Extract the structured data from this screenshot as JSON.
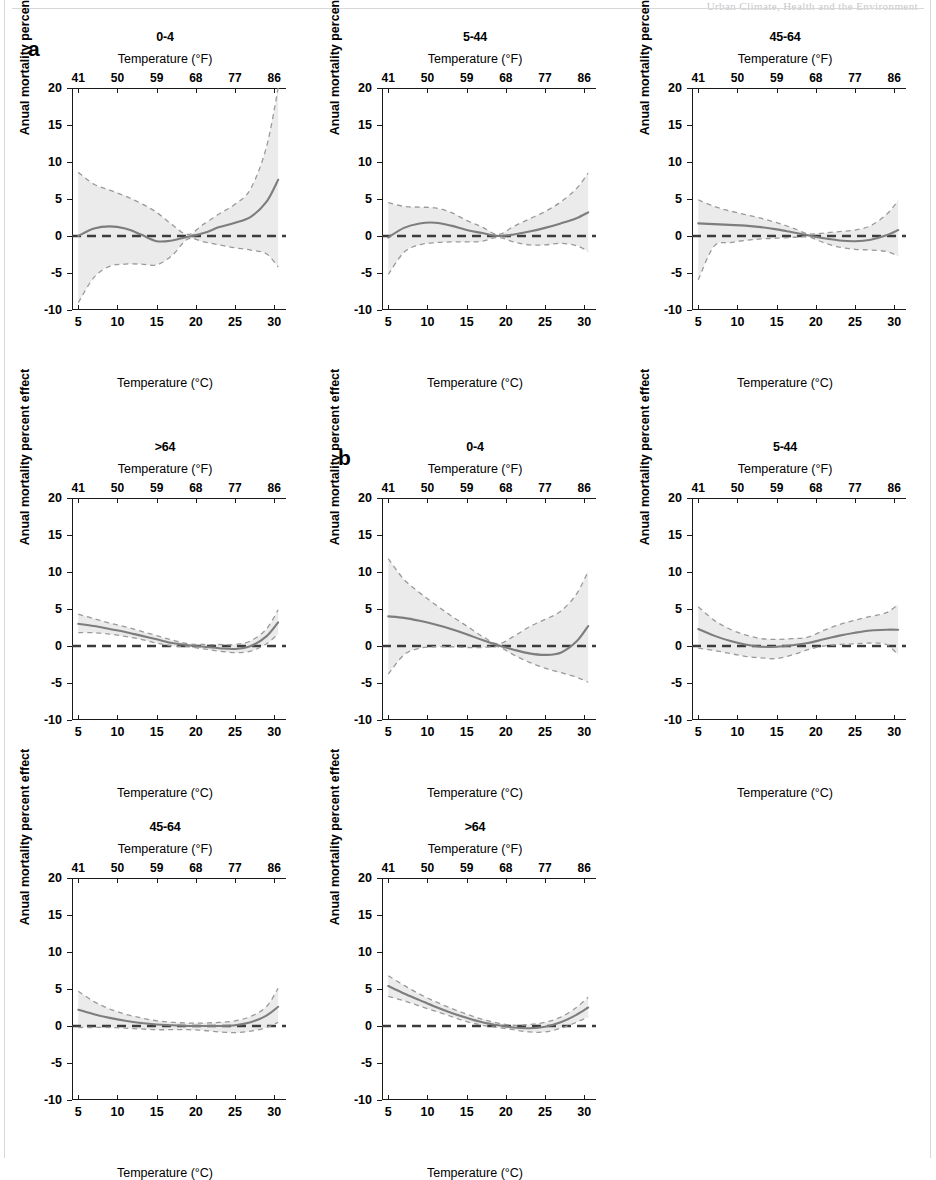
{
  "figure": {
    "running_header": "Urban Climate, Health and the Environment",
    "panel_labels": {
      "a": "a",
      "b": "b"
    },
    "axis": {
      "ylabel": "Anual mortality percent effect",
      "xlabel_c": "Temperature (°C)",
      "xlabel_f": "Temperature (°F)",
      "yticks": [
        20,
        15,
        10,
        5,
        0,
        -5,
        -10
      ],
      "xticks_c": [
        5,
        10,
        15,
        20,
        25,
        30
      ],
      "xticks_f": [
        41,
        50,
        59,
        68,
        77,
        86
      ],
      "ylim": [
        -10,
        20
      ],
      "xlim": [
        4.2,
        31.5
      ]
    },
    "colors": {
      "curve": "#7d7d7d",
      "ci": "#9a9a9a",
      "band": "#ebebeb",
      "zero_line": "#3c3c3c",
      "axis": "#1a1a1a"
    }
  },
  "chart_data": {
    "type": "line",
    "xlabel": "Temperature (°C)",
    "ylabel": "Anual mortality percent effect",
    "xlim": [
      4.2,
      31.5
    ],
    "ylim": [
      -10,
      20
    ],
    "grid": false,
    "legend": "none",
    "secondary_xaxis": {
      "label": "Temperature (°F)",
      "ticks": [
        41,
        50,
        59,
        68,
        77,
        86
      ]
    },
    "x": [
      5,
      7,
      9,
      11,
      13,
      15,
      17,
      19,
      21,
      23,
      25,
      27,
      29,
      30.5
    ],
    "panels": [
      {
        "group": "a",
        "title": "0-4",
        "row": 1,
        "col": 1,
        "estimate": [
          0.0,
          1.0,
          1.3,
          1.0,
          0.2,
          -0.7,
          -0.6,
          -0.1,
          0.4,
          1.2,
          1.8,
          2.6,
          4.6,
          7.6
        ],
        "ci_upper": [
          8.6,
          7.0,
          6.2,
          5.4,
          4.4,
          3.2,
          1.5,
          0.2,
          1.6,
          3.0,
          4.3,
          6.4,
          12.0,
          20.5
        ],
        "ci_lower": [
          -9.0,
          -5.6,
          -4.1,
          -3.8,
          -3.8,
          -3.9,
          -2.6,
          -0.4,
          -0.8,
          -1.2,
          -1.6,
          -1.9,
          -2.4,
          -4.2
        ]
      },
      {
        "group": "a",
        "title": "5-44",
        "row": 1,
        "col": 2,
        "estimate": [
          -0.2,
          1.1,
          1.7,
          1.8,
          1.4,
          0.8,
          0.4,
          0.0,
          0.2,
          0.6,
          1.1,
          1.7,
          2.4,
          3.2
        ],
        "ci_upper": [
          4.5,
          4.0,
          3.9,
          3.8,
          3.2,
          2.1,
          1.2,
          0.2,
          1.3,
          2.3,
          3.3,
          4.6,
          6.4,
          8.5
        ],
        "ci_lower": [
          -5.2,
          -2.2,
          -1.2,
          -0.9,
          -0.8,
          -0.8,
          -0.7,
          -0.2,
          -0.8,
          -1.2,
          -1.2,
          -1.0,
          -1.3,
          -2.1
        ]
      },
      {
        "group": "a",
        "title": "45-64",
        "row": 1,
        "col": 3,
        "estimate": [
          1.7,
          1.6,
          1.5,
          1.4,
          1.2,
          0.9,
          0.5,
          0.1,
          -0.3,
          -0.6,
          -0.7,
          -0.5,
          0.1,
          0.8
        ],
        "ci_upper": [
          4.9,
          4.0,
          3.4,
          2.9,
          2.4,
          1.8,
          1.1,
          0.3,
          0.4,
          0.6,
          0.8,
          1.4,
          2.9,
          4.8
        ],
        "ci_lower": [
          -5.9,
          -1.4,
          -0.9,
          -0.6,
          -0.4,
          -0.3,
          -0.2,
          -0.1,
          -0.9,
          -1.5,
          -1.8,
          -1.9,
          -2.1,
          -2.7
        ]
      },
      {
        "group": "a",
        "title": ">64",
        "row": 2,
        "col": 1,
        "estimate": [
          3.0,
          2.7,
          2.3,
          1.9,
          1.4,
          0.9,
          0.4,
          0.1,
          -0.1,
          -0.3,
          -0.4,
          0.0,
          1.3,
          3.2
        ],
        "ci_upper": [
          4.3,
          3.7,
          3.1,
          2.6,
          2.0,
          1.4,
          0.8,
          0.3,
          0.2,
          0.2,
          0.2,
          0.7,
          2.3,
          4.9
        ],
        "ci_lower": [
          1.8,
          1.8,
          1.6,
          1.3,
          0.9,
          0.4,
          0.0,
          -0.1,
          -0.4,
          -0.7,
          -0.9,
          -0.7,
          0.3,
          1.6
        ]
      },
      {
        "group": "b",
        "title": "0-4",
        "row": 2,
        "col": 2,
        "estimate": [
          4.0,
          3.8,
          3.4,
          2.9,
          2.3,
          1.6,
          0.8,
          0.1,
          -0.5,
          -1.0,
          -1.2,
          -0.9,
          0.6,
          2.7
        ],
        "ci_upper": [
          11.8,
          9.0,
          7.2,
          5.6,
          4.1,
          2.7,
          1.3,
          0.3,
          1.3,
          2.6,
          3.6,
          4.7,
          7.0,
          10.1
        ],
        "ci_lower": [
          -3.8,
          -1.2,
          -0.3,
          -0.1,
          -0.1,
          -0.2,
          -0.2,
          -0.1,
          -1.2,
          -2.2,
          -3.0,
          -3.6,
          -4.2,
          -4.9
        ]
      },
      {
        "group": "b",
        "title": "5-44",
        "row": 2,
        "col": 3,
        "estimate": [
          2.3,
          1.4,
          0.7,
          0.2,
          -0.1,
          -0.1,
          0.1,
          0.4,
          0.9,
          1.4,
          1.8,
          2.1,
          2.2,
          2.2
        ],
        "ci_upper": [
          5.3,
          3.5,
          2.3,
          1.5,
          1.0,
          0.9,
          1.0,
          1.2,
          2.1,
          2.9,
          3.5,
          4.0,
          4.5,
          5.6
        ],
        "ci_lower": [
          -0.3,
          -0.6,
          -1.0,
          -1.4,
          -1.6,
          -1.7,
          -1.2,
          -0.5,
          0.0,
          0.2,
          0.3,
          0.4,
          0.2,
          -1.2
        ]
      },
      {
        "group": "b",
        "title": "45-64",
        "row": 3,
        "col": 1,
        "estimate": [
          2.2,
          1.6,
          1.1,
          0.7,
          0.4,
          0.2,
          0.1,
          0.0,
          0.0,
          0.0,
          0.1,
          0.5,
          1.4,
          2.6
        ],
        "ci_upper": [
          4.7,
          3.3,
          2.3,
          1.6,
          1.1,
          0.7,
          0.5,
          0.4,
          0.4,
          0.5,
          0.7,
          1.3,
          2.6,
          5.1
        ],
        "ci_lower": [
          -0.2,
          -0.2,
          -0.2,
          -0.3,
          -0.4,
          -0.5,
          -0.5,
          -0.5,
          -0.6,
          -0.8,
          -0.9,
          -0.7,
          -0.2,
          0.5
        ]
      },
      {
        "group": "b",
        "title": ">64",
        "row": 3,
        "col": 2,
        "estimate": [
          5.4,
          4.4,
          3.5,
          2.6,
          1.8,
          1.1,
          0.5,
          0.1,
          -0.2,
          -0.3,
          -0.1,
          0.5,
          1.5,
          2.5
        ],
        "ci_upper": [
          6.8,
          5.5,
          4.3,
          3.3,
          2.4,
          1.6,
          0.9,
          0.4,
          0.1,
          0.2,
          0.5,
          1.2,
          2.5,
          3.9
        ],
        "ci_lower": [
          4.0,
          3.4,
          2.7,
          2.0,
          1.3,
          0.6,
          0.1,
          -0.2,
          -0.5,
          -0.8,
          -0.8,
          -0.3,
          0.5,
          1.2
        ]
      }
    ]
  }
}
